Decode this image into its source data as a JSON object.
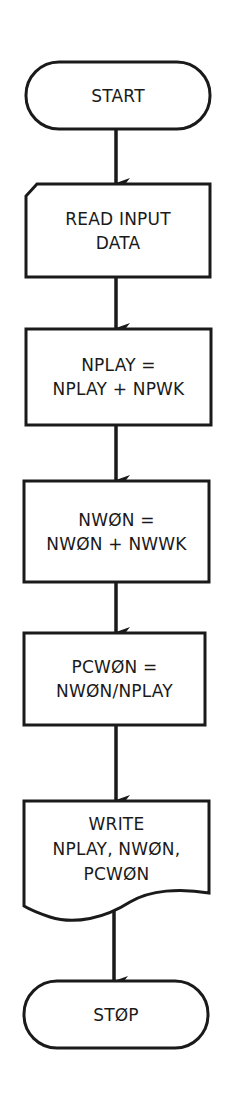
{
  "diagram": {
    "type": "flowchart",
    "direction": "top-to-bottom",
    "line_color": "#1a1a1a",
    "background": "#ffffff",
    "nodes": [
      {
        "id": "start",
        "shape": "terminal",
        "lines": [
          "START"
        ]
      },
      {
        "id": "read",
        "shape": "punched-card-input",
        "lines": [
          "READ INPUT",
          "DATA"
        ]
      },
      {
        "id": "nplay",
        "shape": "process",
        "lines": [
          "NPLAY =",
          "NPLAY + NPWK"
        ]
      },
      {
        "id": "nwon",
        "shape": "process",
        "lines": [
          "NWØN =",
          "NWØN + NWWK"
        ]
      },
      {
        "id": "pcwon",
        "shape": "process",
        "lines": [
          "PCWØN =",
          "NWØN/NPLAY"
        ]
      },
      {
        "id": "write",
        "shape": "document-output",
        "lines": [
          "WRITE",
          "NPLAY, NWØN,",
          "PCWØN"
        ]
      },
      {
        "id": "stop",
        "shape": "terminal",
        "lines": [
          "STØP"
        ]
      }
    ],
    "edges": [
      {
        "from": "start",
        "to": "read"
      },
      {
        "from": "read",
        "to": "nplay"
      },
      {
        "from": "nplay",
        "to": "nwon"
      },
      {
        "from": "nwon",
        "to": "pcwon"
      },
      {
        "from": "pcwon",
        "to": "write"
      },
      {
        "from": "write",
        "to": "stop"
      }
    ]
  }
}
